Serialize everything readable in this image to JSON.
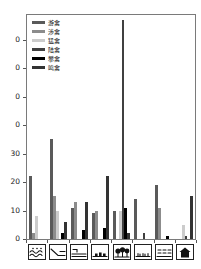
{
  "figure": {
    "background": "#ffffff",
    "plot_border_color": "#7a7a7a"
  },
  "y_axis": {
    "tick_labels_top_to_bottom": [
      "0",
      "0",
      "0",
      "0",
      "30",
      "20",
      "10",
      "0"
    ]
  },
  "chart_data": {
    "type": "bar",
    "grouped": true,
    "title": "",
    "xlabel": "",
    "ylabel": "",
    "ylim": [
      0,
      78
    ],
    "yticks": [
      0,
      10,
      20,
      30,
      40,
      50,
      60,
      70
    ],
    "grid": false,
    "legend_position": "top-left-inside",
    "categories": [
      "open-water",
      "mudflat-shore",
      "channel-boat",
      "settlement",
      "woodland",
      "grassland",
      "paddy-field",
      "building"
    ],
    "category_icons": [
      "open-water-icon",
      "mudflat-shore-icon",
      "channel-boat-icon",
      "settlement-icon",
      "woodland-icon",
      "grassland-icon",
      "paddy-field-icon",
      "building-icon"
    ],
    "series": [
      {
        "name": "游禽",
        "color": "#5a5a5a",
        "values": [
          22,
          35,
          11,
          9,
          10,
          14,
          19,
          0
        ]
      },
      {
        "name": "涉禽",
        "color": "#8c8c8c",
        "values": [
          2,
          15,
          13,
          10,
          0,
          0,
          11,
          0
        ]
      },
      {
        "name": "猛禽",
        "color": "#cccccc",
        "values": [
          8,
          10,
          0,
          0,
          10,
          0,
          0,
          5
        ]
      },
      {
        "name": "陆禽",
        "color": "#404040",
        "values": [
          0,
          0,
          0,
          0,
          77,
          2,
          0,
          1
        ]
      },
      {
        "name": "攀禽",
        "color": "#000000",
        "values": [
          0,
          2,
          3,
          4,
          11,
          0,
          1,
          0
        ]
      },
      {
        "name": "鸣禽",
        "color": "#333333",
        "values": [
          0,
          6,
          13,
          22,
          2,
          0,
          0,
          15
        ]
      }
    ]
  }
}
